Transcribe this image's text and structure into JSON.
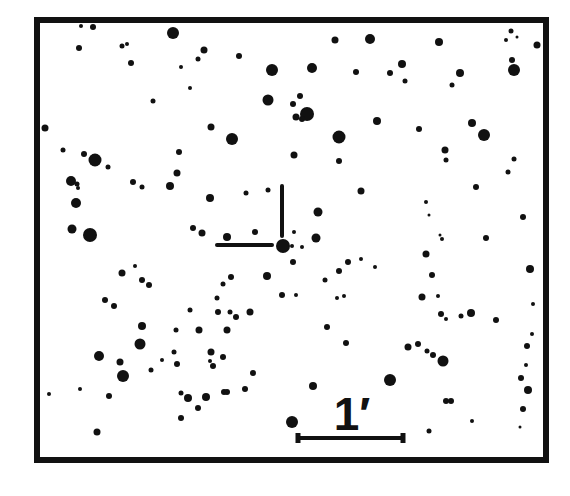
{
  "finder_chart": {
    "frame": {
      "x": 37,
      "y": 20,
      "width": 509,
      "height": 440,
      "stroke": 6,
      "color": "#111111"
    },
    "background": "#ffffff",
    "star_color": "#111111",
    "reticle": {
      "target": {
        "x": 283,
        "y": 246,
        "r": 7
      },
      "vertical_tick": {
        "x": 282,
        "y1": 186,
        "y2": 236
      },
      "horizontal_tick": {
        "x1": 217,
        "x2": 272,
        "y": 245
      },
      "stroke": 4
    },
    "scale_bar": {
      "label": "1′",
      "label_x": 352,
      "label_y": 430,
      "x1": 298,
      "x2": 403,
      "y": 438,
      "stroke": 4,
      "end_cap_height": 10
    },
    "stars": [
      [
        81,
        26,
        2
      ],
      [
        93,
        27,
        3
      ],
      [
        173,
        33,
        6
      ],
      [
        79,
        48,
        3
      ],
      [
        122,
        46,
        2.5
      ],
      [
        127,
        44,
        2
      ],
      [
        131,
        63,
        3
      ],
      [
        204,
        50,
        3.5
      ],
      [
        239,
        56,
        3
      ],
      [
        198,
        59,
        2.5
      ],
      [
        181,
        67,
        2
      ],
      [
        272,
        70,
        6
      ],
      [
        335,
        40,
        3.5
      ],
      [
        370,
        39,
        5
      ],
      [
        439,
        42,
        4
      ],
      [
        511,
        31,
        2.5
      ],
      [
        517,
        37,
        1.5
      ],
      [
        537,
        45,
        3.5
      ],
      [
        506,
        40,
        2
      ],
      [
        312,
        68,
        5
      ],
      [
        356,
        72,
        3
      ],
      [
        390,
        73,
        3
      ],
      [
        402,
        64,
        4
      ],
      [
        405,
        81,
        2.5
      ],
      [
        452,
        85,
        2.5
      ],
      [
        460,
        73,
        4
      ],
      [
        512,
        60,
        3
      ],
      [
        514,
        70,
        6
      ],
      [
        45,
        128,
        3.5
      ],
      [
        153,
        101,
        2.5
      ],
      [
        190,
        88,
        2
      ],
      [
        268,
        100,
        5.5
      ],
      [
        293,
        104,
        3
      ],
      [
        296,
        117,
        3.5
      ],
      [
        307,
        114,
        7
      ],
      [
        302,
        119,
        3
      ],
      [
        300,
        96,
        3
      ],
      [
        377,
        121,
        4
      ],
      [
        339,
        137,
        6.5
      ],
      [
        419,
        129,
        3
      ],
      [
        472,
        123,
        4
      ],
      [
        484,
        135,
        6
      ],
      [
        232,
        139,
        6
      ],
      [
        211,
        127,
        3.5
      ],
      [
        63,
        150,
        2.5
      ],
      [
        84,
        154,
        3
      ],
      [
        95,
        160,
        6.5
      ],
      [
        108,
        167,
        2.5
      ],
      [
        71,
        181,
        5
      ],
      [
        77,
        184,
        2.5
      ],
      [
        78,
        188,
        2
      ],
      [
        133,
        182,
        3
      ],
      [
        142,
        187,
        2.5
      ],
      [
        179,
        152,
        3
      ],
      [
        177,
        173,
        3.5
      ],
      [
        170,
        186,
        4
      ],
      [
        210,
        198,
        4
      ],
      [
        246,
        193,
        2.5
      ],
      [
        268,
        190,
        2.5
      ],
      [
        294,
        155,
        3.5
      ],
      [
        339,
        161,
        3
      ],
      [
        361,
        191,
        3.5
      ],
      [
        445,
        150,
        3.5
      ],
      [
        446,
        160,
        2.5
      ],
      [
        514,
        159,
        2.5
      ],
      [
        508,
        172,
        2.5
      ],
      [
        476,
        187,
        3
      ],
      [
        426,
        202,
        2
      ],
      [
        429,
        215,
        1.5
      ],
      [
        523,
        217,
        3
      ],
      [
        76,
        203,
        5
      ],
      [
        72,
        229,
        4.5
      ],
      [
        90,
        235,
        7
      ],
      [
        193,
        228,
        3
      ],
      [
        202,
        233,
        3.5
      ],
      [
        227,
        237,
        4
      ],
      [
        255,
        232,
        3
      ],
      [
        318,
        212,
        4.5
      ],
      [
        316,
        238,
        4.5
      ],
      [
        292,
        246,
        2
      ],
      [
        486,
        238,
        3
      ],
      [
        442,
        239,
        2
      ],
      [
        294,
        232,
        2
      ],
      [
        135,
        266,
        2
      ],
      [
        122,
        273,
        3.5
      ],
      [
        142,
        280,
        3
      ],
      [
        149,
        285,
        3
      ],
      [
        105,
        300,
        3
      ],
      [
        114,
        306,
        3
      ],
      [
        361,
        259,
        2
      ],
      [
        348,
        262,
        3
      ],
      [
        339,
        271,
        3
      ],
      [
        375,
        267,
        2
      ],
      [
        325,
        280,
        2.5
      ],
      [
        426,
        254,
        3.5
      ],
      [
        432,
        275,
        3
      ],
      [
        530,
        269,
        4
      ],
      [
        223,
        284,
        2.5
      ],
      [
        231,
        277,
        3
      ],
      [
        267,
        276,
        4
      ],
      [
        217,
        298,
        2.5
      ],
      [
        218,
        312,
        3
      ],
      [
        230,
        312,
        2.5
      ],
      [
        236,
        317,
        3
      ],
      [
        250,
        312,
        3.5
      ],
      [
        190,
        310,
        2.5
      ],
      [
        176,
        330,
        2.5
      ],
      [
        142,
        326,
        4
      ],
      [
        140,
        344,
        5.5
      ],
      [
        199,
        330,
        3.5
      ],
      [
        227,
        330,
        3.5
      ],
      [
        282,
        295,
        3
      ],
      [
        296,
        295,
        2
      ],
      [
        293,
        262,
        3
      ],
      [
        302,
        247,
        2
      ],
      [
        327,
        327,
        3
      ],
      [
        337,
        298,
        2
      ],
      [
        344,
        296,
        2
      ],
      [
        346,
        343,
        3
      ],
      [
        422,
        297,
        3.5
      ],
      [
        438,
        296,
        2
      ],
      [
        441,
        314,
        3
      ],
      [
        446,
        319,
        2
      ],
      [
        471,
        313,
        4
      ],
      [
        461,
        316,
        2.5
      ],
      [
        496,
        320,
        3
      ],
      [
        533,
        304,
        2
      ],
      [
        532,
        334,
        2
      ],
      [
        527,
        346,
        3
      ],
      [
        99,
        356,
        5
      ],
      [
        120,
        362,
        3.5
      ],
      [
        162,
        360,
        2
      ],
      [
        177,
        364,
        3
      ],
      [
        174,
        352,
        2.5
      ],
      [
        211,
        352,
        3.5
      ],
      [
        223,
        357,
        3
      ],
      [
        253,
        373,
        3
      ],
      [
        245,
        389,
        3
      ],
      [
        224,
        392,
        3
      ],
      [
        213,
        366,
        3
      ],
      [
        210,
        361,
        2
      ],
      [
        408,
        347,
        3.5
      ],
      [
        418,
        344,
        3
      ],
      [
        427,
        351,
        2.5
      ],
      [
        433,
        355,
        3
      ],
      [
        443,
        361,
        5.5
      ],
      [
        521,
        378,
        3
      ],
      [
        526,
        365,
        2
      ],
      [
        109,
        396,
        3
      ],
      [
        80,
        389,
        2
      ],
      [
        123,
        376,
        6
      ],
      [
        151,
        370,
        2.5
      ],
      [
        181,
        393,
        2.5
      ],
      [
        188,
        398,
        4
      ],
      [
        206,
        397,
        4
      ],
      [
        198,
        408,
        3
      ],
      [
        227,
        392,
        3
      ],
      [
        313,
        386,
        4
      ],
      [
        390,
        380,
        6
      ],
      [
        446,
        401,
        3
      ],
      [
        451,
        401,
        3
      ],
      [
        528,
        390,
        4
      ],
      [
        523,
        409,
        3
      ],
      [
        472,
        421,
        2
      ],
      [
        520,
        427,
        1.5
      ],
      [
        97,
        432,
        3.5
      ],
      [
        181,
        418,
        3
      ],
      [
        292,
        422,
        6
      ],
      [
        429,
        431,
        2.5
      ],
      [
        49,
        394,
        2
      ],
      [
        440,
        235,
        1.5
      ]
    ]
  }
}
